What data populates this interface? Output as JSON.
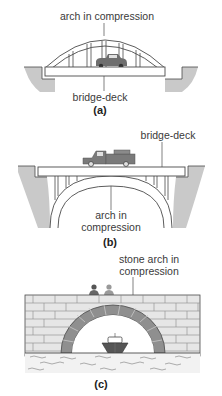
{
  "colors": {
    "line": "#4a4a4a",
    "ground": "#c9c9c9",
    "stone": "#8f8f8f",
    "brick": "#e6e6e6",
    "vehicle": "#6e6e6e",
    "water": "#f2f2f2"
  },
  "panels": [
    {
      "id": "a",
      "caption": "(a)",
      "labels": {
        "top": "arch in compression",
        "bottom": "bridge-deck"
      }
    },
    {
      "id": "b",
      "caption": "(b)",
      "labels": {
        "top": "bridge-deck",
        "bottom_line1": "arch in",
        "bottom_line2": "compression"
      }
    },
    {
      "id": "c",
      "caption": "(c)",
      "labels": {
        "top_line1": "stone arch in",
        "top_line2": "compression"
      }
    }
  ]
}
